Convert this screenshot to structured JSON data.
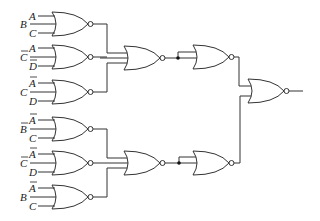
{
  "diagram": {
    "type": "logic-circuit",
    "gate_type": "NOR",
    "first_level_gates": [
      {
        "id": "g1",
        "inputs": [
          {
            "name": "A",
            "bar": false
          },
          {
            "name": "B",
            "bar": false
          },
          {
            "name": "C",
            "bar": false
          }
        ]
      },
      {
        "id": "g2",
        "inputs": [
          {
            "name": "A",
            "bar": false
          },
          {
            "name": "C",
            "bar": true
          },
          {
            "name": "D",
            "bar": true
          }
        ]
      },
      {
        "id": "g3",
        "inputs": [
          {
            "name": "A",
            "bar": true
          },
          {
            "name": "C",
            "bar": false
          },
          {
            "name": "D",
            "bar": false
          }
        ]
      },
      {
        "id": "g4",
        "inputs": [
          {
            "name": "A",
            "bar": true
          },
          {
            "name": "B",
            "bar": true
          },
          {
            "name": "C",
            "bar": false
          }
        ]
      },
      {
        "id": "g5",
        "inputs": [
          {
            "name": "A",
            "bar": true
          },
          {
            "name": "C",
            "bar": true
          },
          {
            "name": "D",
            "bar": false
          }
        ]
      },
      {
        "id": "g6",
        "inputs": [
          {
            "name": "A",
            "bar": true
          },
          {
            "name": "B",
            "bar": false
          },
          {
            "name": "C",
            "bar": false
          }
        ]
      }
    ],
    "second_level_gates": [
      {
        "id": "g7",
        "inputs": [
          "g1",
          "g2",
          "g3"
        ]
      },
      {
        "id": "g9",
        "inputs": [
          "g4",
          "g5",
          "g6"
        ]
      }
    ],
    "inverter_gates": [
      {
        "id": "g8",
        "inputs": [
          "g7",
          "g7"
        ],
        "note": "NOR with tied inputs"
      },
      {
        "id": "g10",
        "inputs": [
          "g9",
          "g9"
        ],
        "note": "NOR with tied inputs"
      }
    ],
    "output_gate": {
      "id": "g11",
      "inputs": [
        "g8",
        "g10"
      ]
    }
  },
  "labels": {
    "g1": {
      "top": "A",
      "mid": "B",
      "bot": "C"
    },
    "g2": {
      "top": "A",
      "mid": "C",
      "bot": "D"
    },
    "g3": {
      "top": "A",
      "mid": "C",
      "bot": "D"
    },
    "g4": {
      "top": "A",
      "mid": "B",
      "bot": "C"
    },
    "g5": {
      "top": "A",
      "mid": "C",
      "bot": "D"
    },
    "g6": {
      "top": "A",
      "mid": "B",
      "bot": "C"
    }
  }
}
